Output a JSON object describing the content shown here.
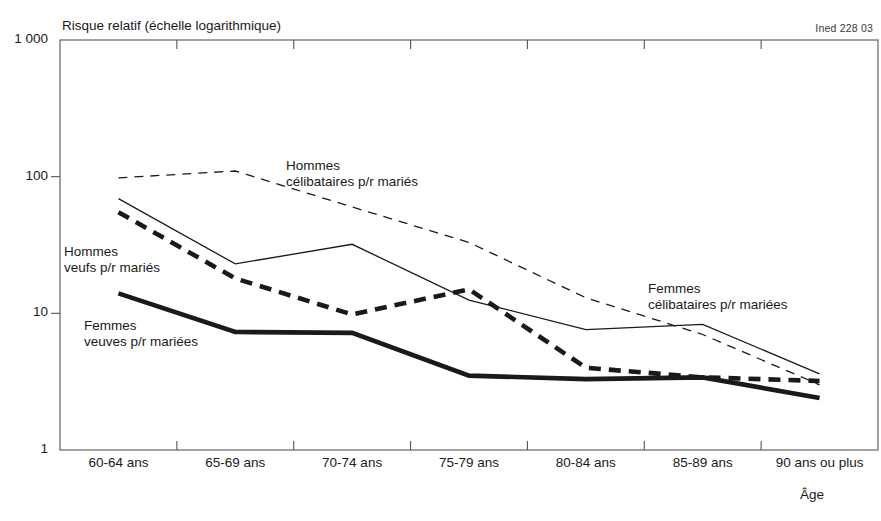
{
  "figure": {
    "source_credit": "Ined 228 03",
    "y_axis_title": "Risque relatif (échelle logarithmique)",
    "x_axis_title": "Âge"
  },
  "chart_data": {
    "type": "line",
    "title": "Risque relatif (échelle logarithmique)",
    "xlabel": "Âge",
    "ylabel": "Risque relatif (échelle logarithmique)",
    "scale": "log",
    "ylim": [
      1,
      1000
    ],
    "yticks": [
      1,
      10,
      100,
      1000
    ],
    "ytick_labels": [
      "1",
      "10",
      "100",
      "1 000"
    ],
    "grid": false,
    "legend": "inline-annotations",
    "categories": [
      "60-64 ans",
      "65-69 ans",
      "70-74 ans",
      "75-79 ans",
      "80-84 ans",
      "85-89 ans",
      "90 ans ou plus"
    ],
    "series": [
      {
        "name": "Hommes célibataires p/r mariés",
        "style": "thin-dashed",
        "values": [
          98,
          110,
          60,
          33,
          13,
          7.0,
          3.0
        ]
      },
      {
        "name": "Femmes célibataires p/r mariées",
        "style": "thin-solid",
        "values": [
          69,
          23,
          32,
          12.5,
          7.6,
          8.3,
          3.6
        ]
      },
      {
        "name": "Hommes veufs p/r mariés",
        "style": "thick-dashed",
        "values": [
          55,
          18,
          9.8,
          15,
          4.0,
          3.4,
          3.2
        ]
      },
      {
        "name": "Femmes veuves p/r mariées",
        "style": "thick-solid",
        "values": [
          14,
          7.3,
          7.2,
          3.5,
          3.3,
          3.4,
          2.4
        ]
      }
    ]
  },
  "annotations": [
    {
      "name": "annotation-hommes-celibataires",
      "line1": "Hommes",
      "line2": "célibataires p/r mariés"
    },
    {
      "name": "annotation-hommes-veufs",
      "line1": "Hommes",
      "line2": "veufs p/r mariés"
    },
    {
      "name": "annotation-femmes-veuves",
      "line1": "Femmes",
      "line2": "veuves p/r mariées"
    },
    {
      "name": "annotation-femmes-celibataires",
      "line1": "Femmes",
      "line2": "célibataires p/r mariées"
    }
  ],
  "colors": {
    "ink": "#1a1a1a",
    "axis": "#555555",
    "background": "#ffffff"
  }
}
